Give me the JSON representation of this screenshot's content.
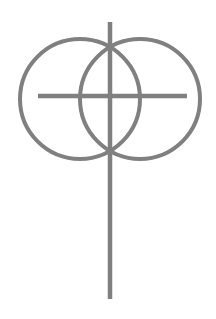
{
  "canvas": {
    "width": 216,
    "height": 319,
    "background_color": "#ffffff",
    "title": "Overlapping circles with cross"
  },
  "style": {
    "stroke_color": "#808080",
    "circle_stroke_width": 4,
    "line_stroke_width": 4.5,
    "fill": "none"
  },
  "chart_data": {
    "type": "diagram",
    "shapes": [
      {
        "name": "left-circle",
        "type": "circle",
        "cx": 80,
        "cy": 99,
        "r": 60,
        "stroke": "#808080",
        "stroke_width": 4,
        "fill": "none"
      },
      {
        "name": "right-circle",
        "type": "circle",
        "cx": 140,
        "cy": 99,
        "r": 60,
        "stroke": "#808080",
        "stroke_width": 4,
        "fill": "none"
      },
      {
        "name": "horizontal-line",
        "type": "line",
        "x1": 38,
        "y1": 96,
        "x2": 187,
        "y2": 96,
        "stroke": "#808080",
        "stroke_width": 4.5
      },
      {
        "name": "vertical-line",
        "type": "line",
        "x1": 110,
        "y1": 22,
        "x2": 110,
        "y2": 299,
        "stroke": "#808080",
        "stroke_width": 4.5
      }
    ]
  }
}
